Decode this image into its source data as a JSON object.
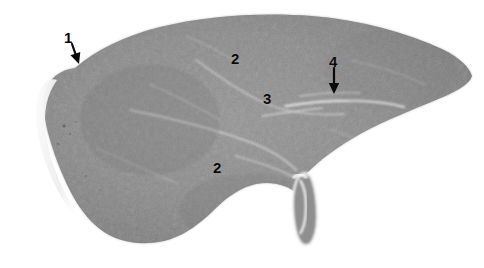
{
  "figure": {
    "kind": "histology-specimen-photograph",
    "modality": "grayscale-light-micrograph",
    "background_color": "#ffffff",
    "parenchyma_color": "#8a8a8a",
    "parenchyma_dark": "#6f6f6f",
    "parenchyma_light": "#a6a6a6",
    "capsule_highlight_color": "#f2f2f2",
    "septa_color": "#e8e8e8",
    "annotation_color": "#0a0a0a"
  },
  "annotations": [
    {
      "id": "callout-1",
      "label": "1",
      "label_x": 64,
      "label_y": 30,
      "has_arrow": true,
      "arrow_type": "diagonal-down-right",
      "arrow_x1": 72,
      "arrow_y1": 44,
      "arrow_x2": 79,
      "arrow_y2": 64,
      "points_to": "capsule-left-margin"
    },
    {
      "id": "callout-2-upper",
      "label": "2",
      "label_x": 231,
      "label_y": 51,
      "has_arrow": false,
      "points_to": "parenchyma-upper"
    },
    {
      "id": "callout-3",
      "label": "3",
      "label_x": 263,
      "label_y": 91,
      "has_arrow": false,
      "points_to": "interlobular-septum"
    },
    {
      "id": "callout-4",
      "label": "4",
      "label_x": 329,
      "label_y": 54,
      "has_arrow": true,
      "arrow_type": "vertical-down",
      "arrow_x1": 334,
      "arrow_y1": 68,
      "arrow_x2": 334,
      "arrow_y2": 94,
      "points_to": "portal-vessel-band"
    },
    {
      "id": "callout-2-lower",
      "label": "2",
      "label_x": 213,
      "label_y": 160,
      "has_arrow": false,
      "points_to": "parenchyma-lower"
    }
  ],
  "specimen": {
    "outline_path": "M 75 68 C 96 50 124 36 160 27 C 205 16 260 12 312 16 C 360 20 406 32 444 50 C 460 58 470 68 472 76 C 470 84 456 92 436 100 C 412 110 386 120 362 133 C 338 146 320 160 308 172 C 302 178 300 184 300 190 L 300 196 C 296 192 290 188 284 186 C 276 183 266 182 256 184 C 242 187 228 196 216 208 C 206 218 196 226 186 232 C 176 238 164 242 150 243 C 132 244 116 240 104 232 C 92 224 82 212 74 198 C 64 180 56 160 50 140 C 44 120 42 102 46 90 C 50 78 60 70 75 68 Z",
    "capsule_highlight_path": "M 57 80 C 47 94 43 112 46 132 C 48 152 55 174 66 194 C 72 206 80 218 90 228 C 80 222 70 212 62 198 C 50 178 42 156 38 134 C 34 112 36 94 44 84 C 48 80 52 78 57 80 Z",
    "gallbladder_path": "M 299 176 C 303 172 308 172 311 177 C 314 183 316 194 317 206 C 318 220 317 232 313 240 C 310 246 305 247 301 243 C 297 238 294 226 293 212 C 292 198 294 184 299 176 Z",
    "septa": [
      {
        "d": "M 130 110 C 170 118 210 128 244 140 C 268 148 284 158 296 170",
        "w": 2.0,
        "o": 0.55
      },
      {
        "d": "M 196 60 C 218 76 238 90 258 100 C 282 112 312 116 344 114",
        "w": 1.8,
        "o": 0.5
      },
      {
        "d": "M 286 106 C 310 102 336 100 362 101 C 380 102 394 104 404 107",
        "w": 2.6,
        "o": 0.85
      },
      {
        "d": "M 262 116 C 284 113 304 110 322 108",
        "w": 1.6,
        "o": 0.7
      },
      {
        "d": "M 300 96 C 320 93 342 92 360 93",
        "w": 1.4,
        "o": 0.6
      },
      {
        "d": "M 150 84 C 176 96 200 108 220 120",
        "w": 1.3,
        "o": 0.4
      },
      {
        "d": "M 236 156 C 258 162 276 168 292 176",
        "w": 1.8,
        "o": 0.55
      },
      {
        "d": "M 352 60 C 378 66 402 74 424 84",
        "w": 1.2,
        "o": 0.35
      },
      {
        "d": "M 96 148 C 124 160 152 172 178 184",
        "w": 1.2,
        "o": 0.32
      },
      {
        "d": "M 330 130 C 352 136 372 144 390 152",
        "w": 1.2,
        "o": 0.3
      },
      {
        "d": "M 186 36 C 206 44 224 54 240 64",
        "w": 1.1,
        "o": 0.28
      }
    ]
  }
}
